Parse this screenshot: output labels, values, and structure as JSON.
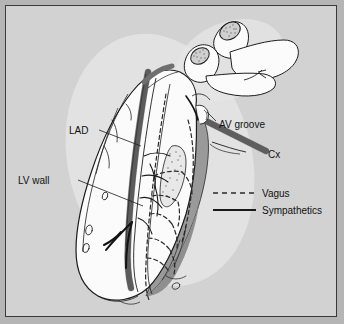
{
  "figure": {
    "type": "anatomical-line-illustration",
    "background_color": "#d2d2d2",
    "outer_color": "#b5b5b5",
    "border_color": "#3a3a3a"
  },
  "labels": {
    "lad": "LAD",
    "lv_wall": "LV wall",
    "av_groove": "AV groove",
    "cx": "Cx"
  },
  "legend": {
    "items": [
      {
        "label": "Vagus",
        "style": "dashed",
        "color": "#2a2a2a"
      },
      {
        "label": "Sympathetics",
        "style": "solid",
        "color": "#1a1a1a"
      }
    ]
  },
  "structures": {
    "heart_fill": "#fbfbfb",
    "shadow_fill": "#9a9a9a",
    "vessel_fill": "#6f6f6f",
    "stipple_fill": "#c9c9c9",
    "outline": "#1d1d1d"
  }
}
